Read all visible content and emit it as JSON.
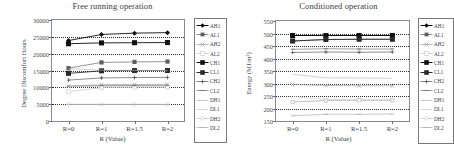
{
  "figure": {
    "panels": [
      {
        "id": "free-running",
        "title": "Free running operation",
        "xlabel": "R (Value)",
        "ylabel": "Degree Discomfort Hours"
      },
      {
        "id": "conditioned",
        "title": "Conditioned operation",
        "xlabel": "R (Value)",
        "ylabel": "Energy (MJ/m²)"
      }
    ],
    "series_names": [
      "AH1",
      "AL1",
      "AH2",
      "AL2",
      "CH1",
      "CL1",
      "CH2",
      "CL2",
      "DH1",
      "DL1",
      "DH2",
      "DL2"
    ],
    "colors": {
      "dark": "#101010",
      "mid": "#5d5d5d",
      "light": "#9e9e9e",
      "pale": "#c3c3c3",
      "axis": "#8a8a8a",
      "grid": "#3a3a3a"
    }
  },
  "chart_data": [
    {
      "type": "line",
      "title": "Free running operation",
      "xlabel": "R (Value)",
      "ylabel": "Degree Discomfort Hours",
      "categories": [
        "R=0",
        "R=1",
        "R=1.5",
        "R=2"
      ],
      "ylim": [
        0,
        30000
      ],
      "yticks": [
        0,
        5000,
        10000,
        15000,
        20000,
        25000,
        30000
      ],
      "ytick_labels": [
        "0",
        "5000",
        "10000",
        "15000",
        "20000",
        "25000",
        "30000"
      ],
      "grid": true,
      "legend_position": "right-outside",
      "series": [
        {
          "name": "AH1",
          "marker": "filled-diamond",
          "color": "#101010",
          "values": [
            23900,
            25700,
            26100,
            26250
          ]
        },
        {
          "name": "AL1",
          "marker": "filled-square",
          "color": "#5d5d5d",
          "values": [
            15700,
            17400,
            17550,
            17650
          ]
        },
        {
          "name": "AH2",
          "marker": "cross-open",
          "color": "#9e9e9e",
          "values": [
            10350,
            10800,
            10850,
            10900
          ]
        },
        {
          "name": "AL2",
          "marker": "open-square",
          "color": "#c3c3c3",
          "values": [
            8750,
            9900,
            10000,
            10050
          ]
        },
        {
          "name": "CH1",
          "marker": "filled-square-lg",
          "color": "#101010",
          "values": [
            22950,
            23200,
            23250,
            23300
          ]
        },
        {
          "name": "CL1",
          "marker": "filled-square-lg",
          "color": "#2b2b2b",
          "values": [
            14150,
            14900,
            14980,
            15000
          ]
        },
        {
          "name": "CH2",
          "marker": "plus",
          "color": "#4f4f4f",
          "values": [
            12150,
            12800,
            12900,
            12950
          ]
        },
        {
          "name": "CL2",
          "marker": "dash",
          "color": "#6e6e6e",
          "values": [
            10300,
            10500,
            10550,
            10600
          ]
        },
        {
          "name": "DH1",
          "marker": "none",
          "color": "#b5b5b5",
          "values": [
            15550,
            15100,
            15050,
            14950
          ]
        },
        {
          "name": "DL1",
          "marker": "none",
          "color": "#cccccc",
          "values": [
            10200,
            10250,
            10250,
            10280
          ]
        },
        {
          "name": "DH2",
          "marker": "open-circle",
          "color": "#bdbdbd",
          "values": [
            4950,
            4950,
            4950,
            4950
          ]
        },
        {
          "name": "DL2",
          "marker": "line",
          "color": "#a8a8a8",
          "values": [
            4900,
            4900,
            4900,
            4900
          ]
        }
      ]
    },
    {
      "type": "line",
      "title": "Conditioned operation",
      "xlabel": "R (Value)",
      "ylabel": "Energy (MJ/m²)",
      "categories": [
        "R=0",
        "R=1",
        "R=1.5",
        "R=2"
      ],
      "ylim": [
        150,
        550
      ],
      "yticks": [
        150,
        200,
        250,
        300,
        350,
        400,
        450,
        500,
        550
      ],
      "ytick_labels": [
        "150",
        "200",
        "250",
        "300",
        "350",
        "400",
        "450",
        "500",
        "550"
      ],
      "grid": true,
      "legend_position": "right-outside",
      "series": [
        {
          "name": "AH1",
          "marker": "filled-diamond",
          "color": "#101010",
          "values": [
            492,
            492,
            492,
            492
          ]
        },
        {
          "name": "AL1",
          "marker": "filled-square",
          "color": "#5d5d5d",
          "values": [
            470,
            476,
            477,
            477
          ]
        },
        {
          "name": "AH2",
          "marker": "cross-open",
          "color": "#9e9e9e",
          "values": [
            296,
            292,
            291,
            291
          ]
        },
        {
          "name": "AL2",
          "marker": "open-square",
          "color": "#c3c3c3",
          "values": [
            226,
            232,
            233,
            233
          ]
        },
        {
          "name": "CH1",
          "marker": "filled-square-lg",
          "color": "#101010",
          "values": [
            492,
            492,
            492,
            492
          ]
        },
        {
          "name": "CL1",
          "marker": "filled-square-lg",
          "color": "#2b2b2b",
          "values": [
            470,
            476,
            477,
            477
          ]
        },
        {
          "name": "CH2",
          "marker": "plus",
          "color": "#4f4f4f",
          "values": [
            424,
            426,
            425,
            426
          ]
        },
        {
          "name": "CL2",
          "marker": "dash",
          "color": "#6e6e6e",
          "values": [
            437,
            439,
            438,
            438
          ]
        },
        {
          "name": "DH1",
          "marker": "none",
          "color": "#b5b5b5",
          "values": [
            337,
            323,
            322,
            321
          ]
        },
        {
          "name": "DL1",
          "marker": "none",
          "color": "#cccccc",
          "values": [
            248,
            236,
            235,
            234
          ]
        },
        {
          "name": "DH2",
          "marker": "open-circle",
          "color": "#bdbdbd",
          "values": [
            226,
            232,
            233,
            233
          ]
        },
        {
          "name": "DL2",
          "marker": "line",
          "color": "#a8a8a8",
          "values": [
            171,
            177,
            177,
            178
          ]
        }
      ]
    }
  ]
}
